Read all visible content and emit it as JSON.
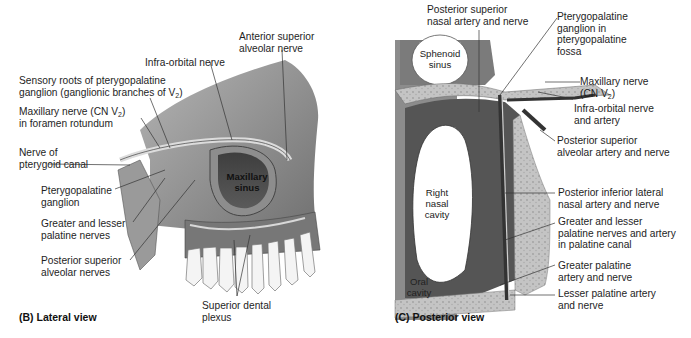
{
  "panels": {
    "lateral": {
      "title": "(B) Lateral view",
      "inner_labels": {
        "maxillary_sinus": "Maxillary sinus"
      },
      "labels": {
        "anterior_superior_1": "Anterior superior",
        "anterior_superior_2": "alveolar nerve",
        "infra_orbital": "Infra-orbital nerve",
        "sensory_roots_1": "Sensory roots of pterygopalatine",
        "sensory_roots_2a": "ganglion (ganglionic branches of V",
        "sensory_roots_2b": "2",
        "sensory_roots_2c": ")",
        "maxillary_1a": "Maxillary nerve (CN V",
        "maxillary_1b": "2",
        "maxillary_1c": ")",
        "maxillary_2": "in foramen rotundum",
        "nerve_of_1": "Nerve of",
        "nerve_of_2": "pterygoid canal",
        "ptg_ganglion_1": "Pterygopalatine",
        "ptg_ganglion_2": "ganglion",
        "greater_lesser_1": "Greater and lesser",
        "greater_lesser_2": "palatine nerves",
        "post_sup_1": "Posterior superior",
        "post_sup_2": "alveolar nerves",
        "dental_plexus_1": "Superior dental",
        "dental_plexus_2": "plexus"
      }
    },
    "posterior": {
      "title": "(C) Posterior view",
      "inner_labels": {
        "sphenoid_1": "Sphenoid",
        "sphenoid_2": "sinus",
        "nasal_1": "Right",
        "nasal_2": "nasal",
        "nasal_3": "cavity",
        "oral_1": "Oral",
        "oral_2": "cavity"
      },
      "labels": {
        "post_sup_nasal_1": "Posterior superior",
        "post_sup_nasal_2": "nasal artery and nerve",
        "ptg_fossa_1": "Pterygopalatine",
        "ptg_fossa_2": "ganglion in",
        "ptg_fossa_3": "pterygopalatine",
        "ptg_fossa_4": "fossa",
        "maxillary_1": "Maxillary nerve",
        "maxillary_2a": "(CN V",
        "maxillary_2b": "2",
        "maxillary_2c": ")",
        "infra_orbital_1": "Infra-orbital nerve",
        "infra_orbital_2": "and artery",
        "psa_1": "Posterior superior",
        "psa_2": "alveolar artery and nerve",
        "pil_1": "Posterior inferior lateral",
        "pil_2": "nasal artery and nerve",
        "gl_canal_1": "Greater and lesser",
        "gl_canal_2": "palatine nerves and artery",
        "gl_canal_3": "in palatine canal",
        "greater_pal_1": "Greater palatine",
        "greater_pal_2": "artery and nerve",
        "lesser_pal_1": "Lesser palatine artery",
        "lesser_pal_2": "and nerve"
      }
    }
  },
  "colors": {
    "bone": "#c9c9c9",
    "bone_dark": "#8a8a8a",
    "sinus_dark": "#4a4a4a",
    "mucosa": "#5e5e5e",
    "nerve": "#d8d8d8",
    "tooth": "#f2f2f2",
    "leader": "#333333"
  }
}
